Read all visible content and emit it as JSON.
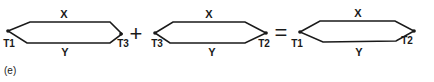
{
  "figure": {
    "caption": "(e)",
    "operators": {
      "plus": "+",
      "equals": "="
    },
    "loops": [
      {
        "top_label": "X",
        "bottom_label": "Y",
        "left_junction": "T1",
        "right_junction": "T3"
      },
      {
        "top_label": "X",
        "bottom_label": "Y",
        "left_junction": "T3",
        "right_junction": "T2"
      },
      {
        "top_label": "X",
        "bottom_label": "Y",
        "left_junction": "T1",
        "right_junction": "T2"
      }
    ],
    "colors": {
      "line": "#1a1a1a",
      "background": "#ffffff"
    }
  }
}
